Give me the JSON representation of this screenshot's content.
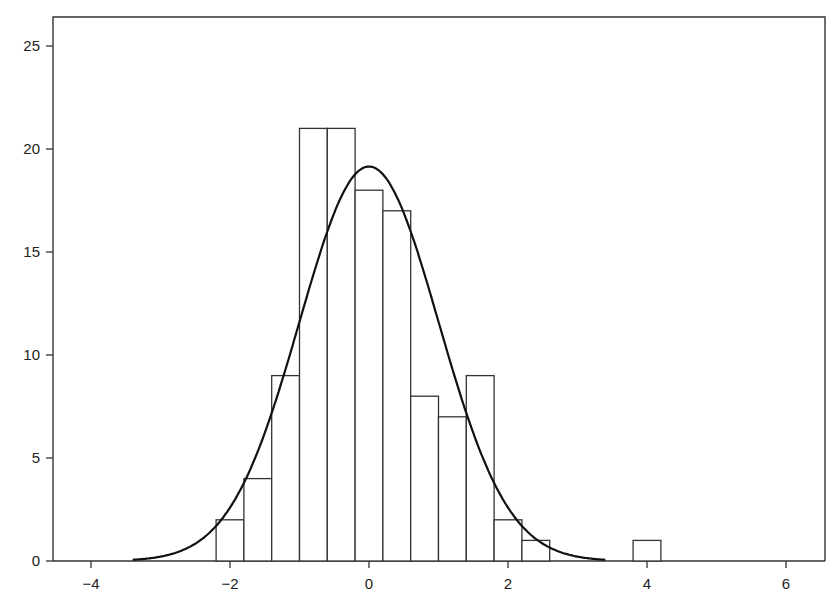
{
  "chart_data": {
    "type": "bar",
    "subtype": "histogram_with_normal_curve",
    "title": "",
    "xlabel": "",
    "ylabel": "",
    "xlim": [
      -4.4,
      6.6
    ],
    "ylim": [
      0,
      26.5
    ],
    "grid": false,
    "legend": null,
    "x_ticks": [
      -4,
      -2,
      0,
      2,
      4,
      6
    ],
    "x_tick_labels": [
      "−4",
      "−2",
      "0",
      "2",
      "4",
      "6"
    ],
    "y_ticks": [
      0,
      5,
      10,
      15,
      20,
      25
    ],
    "y_tick_labels": [
      "0",
      "5",
      "10",
      "15",
      "20",
      "25"
    ],
    "bin_width": 0.4,
    "bins": [
      {
        "start": -2.2,
        "end": -1.8,
        "count": 2
      },
      {
        "start": -1.8,
        "end": -1.4,
        "count": 4
      },
      {
        "start": -1.4,
        "end": -1.0,
        "count": 9
      },
      {
        "start": -1.0,
        "end": -0.6,
        "count": 21
      },
      {
        "start": -0.6,
        "end": -0.2,
        "count": 21
      },
      {
        "start": -0.2,
        "end": 0.2,
        "count": 18
      },
      {
        "start": 0.2,
        "end": 0.6,
        "count": 17
      },
      {
        "start": 0.6,
        "end": 1.0,
        "count": 8
      },
      {
        "start": 1.0,
        "end": 1.4,
        "count": 7
      },
      {
        "start": 1.4,
        "end": 1.8,
        "count": 9
      },
      {
        "start": 1.8,
        "end": 2.2,
        "count": 2
      },
      {
        "start": 2.2,
        "end": 2.6,
        "count": 1
      },
      {
        "start": 3.8,
        "end": 4.2,
        "count": 1
      }
    ],
    "total_count": 120,
    "curve": {
      "type": "normal",
      "mean": 0,
      "sd": 1.0,
      "scale": 48,
      "peak": 19.1,
      "x_range": [
        -3.4,
        3.4
      ]
    }
  }
}
